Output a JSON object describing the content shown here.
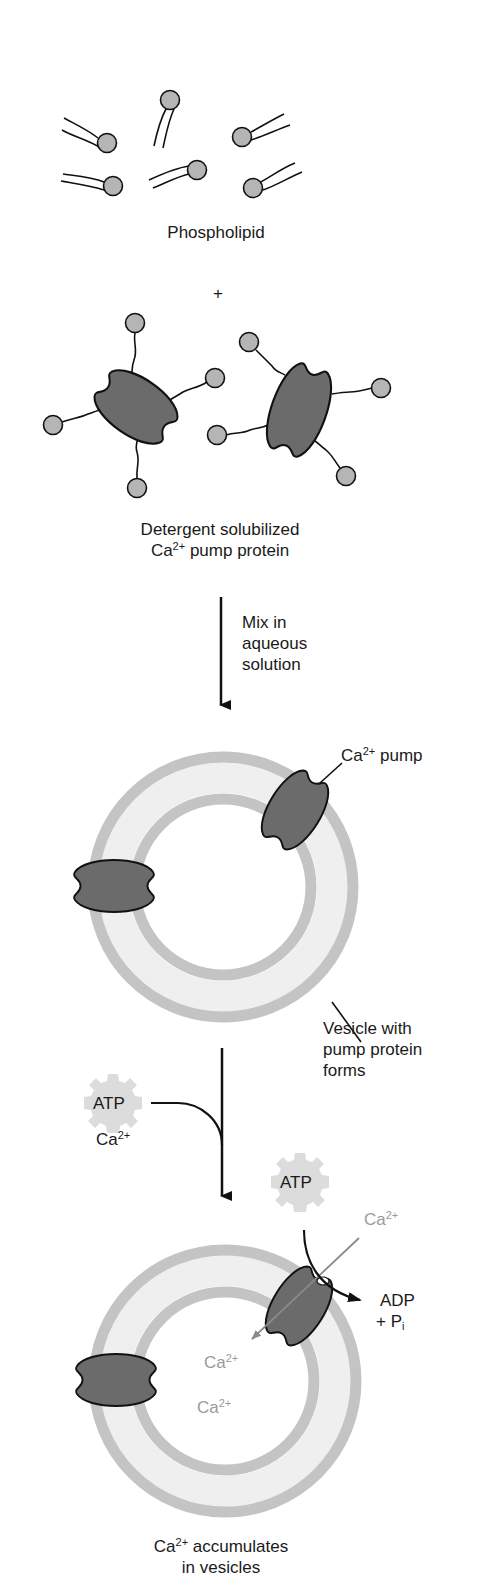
{
  "diagram": {
    "colors": {
      "protein_fill": "#6b6b6b",
      "head_fill": "#b5b5b5",
      "membrane": "#c4c4c4",
      "membrane_interior": "#efefef",
      "atp_gear": "#dcdcdc",
      "grey_text": "#9a9a9a",
      "outline": "#111111"
    },
    "step1": {
      "label": "Phospholipid",
      "plus": "+"
    },
    "step2": {
      "label_line1": "Detergent solubilized",
      "label_ca": "Ca",
      "label_charge": "2+",
      "label_rest": " pump protein"
    },
    "arrow1": {
      "line1": "Mix in",
      "line2": "aqueous",
      "line3": "solution"
    },
    "vesicle1": {
      "pump_label_ca": "Ca",
      "pump_label_charge": "2+",
      "pump_label_rest": " pump",
      "vesicle_line1": "Vesicle with",
      "vesicle_line2": "pump protein",
      "vesicle_line3": "forms"
    },
    "arrow2": {
      "atp": "ATP",
      "ca": "Ca",
      "charge": "2+"
    },
    "vesicle2": {
      "atp": "ATP",
      "ca_outside": "Ca",
      "ca_outside_charge": "2+",
      "adp": "ADP",
      "pi_prefix": "+ P",
      "pi_sub": "i",
      "ca_inside_1": "Ca",
      "ca_inside_1_charge": "2+",
      "ca_inside_2": "Ca",
      "ca_inside_2_charge": "2+"
    },
    "result": {
      "line1_ca": "Ca",
      "line1_charge": "2+",
      "line1_rest": " accumulates",
      "line2": "in vesicles"
    }
  }
}
